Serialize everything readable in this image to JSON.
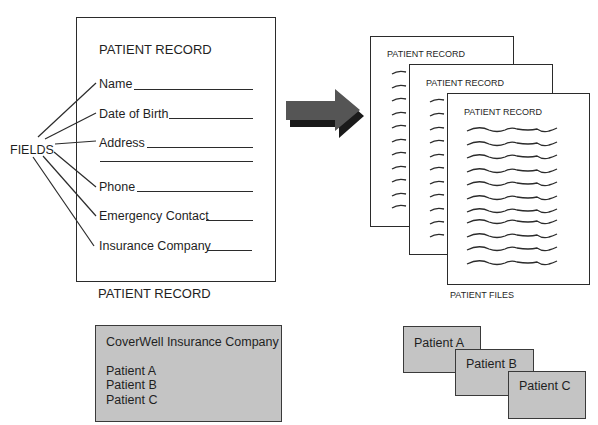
{
  "record_form": {
    "title": "PATIENT RECORD",
    "caption": "PATIENT RECORD",
    "fields": [
      {
        "label": "Name"
      },
      {
        "label": "Date of Birth"
      },
      {
        "label": "Address"
      },
      {
        "label": "Phone"
      },
      {
        "label": "Emergency Contact"
      },
      {
        "label": "Insurance Company"
      }
    ]
  },
  "fields_label": "FIELDS",
  "arrow": {
    "icon": "right-arrow-icon",
    "color": "#555555"
  },
  "patient_files": {
    "caption": "PATIENT FILES",
    "pages": [
      {
        "title": "PATIENT RECORD"
      },
      {
        "title": "PATIENT RECORD"
      },
      {
        "title": "PATIENT RECORD"
      }
    ]
  },
  "insurance_box": {
    "company": "CoverWell Insurance Company",
    "patients": [
      "Patient A",
      "Patient B",
      "Patient C"
    ],
    "fill": "#c4c4c4"
  },
  "patient_cards": [
    {
      "label": "Patient A"
    },
    {
      "label": "Patient B"
    },
    {
      "label": "Patient C"
    }
  ]
}
